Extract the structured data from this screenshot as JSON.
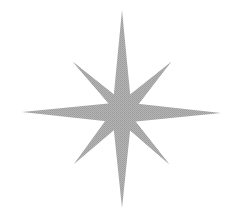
{
  "figure": {
    "background_color": "#ffffff",
    "fill_color": "#a9a9a9",
    "center": [
      122,
      112
    ],
    "tips": {
      "north": [
        122,
        10
      ],
      "south": [
        122,
        208
      ],
      "west": [
        22,
        112
      ],
      "east": [
        221,
        113
      ],
      "north_west": [
        73,
        62
      ],
      "north_east": [
        171,
        62
      ],
      "south_west": [
        74,
        164
      ],
      "south_east": [
        169,
        164
      ]
    }
  }
}
